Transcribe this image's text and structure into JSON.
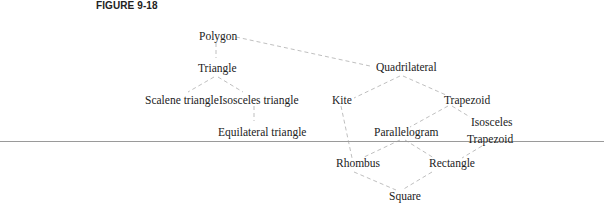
{
  "figure": {
    "title": "FIGURE 9-18"
  },
  "nodes": {
    "polygon": "Polygon",
    "triangle": "Triangle",
    "scalene": "Scalene triangle",
    "isosceles_triangle": "Isosceles triangle",
    "equilateral": "Equilateral triangle",
    "quadrilateral": "Quadrilateral",
    "kite": "Kite",
    "trapezoid": "Trapezoid",
    "isosceles_trapezoid_line1": "Isosceles",
    "isosceles_trapezoid_line2": "Trapezoid",
    "parallelogram": "Parallelogram",
    "rhombus": "Rhombus",
    "rectangle": "Rectangle",
    "square": "Square"
  },
  "edges": [
    [
      "Polygon",
      "Triangle"
    ],
    [
      "Polygon",
      "Quadrilateral"
    ],
    [
      "Triangle",
      "Scalene triangle"
    ],
    [
      "Triangle",
      "Isosceles triangle"
    ],
    [
      "Isosceles triangle",
      "Equilateral triangle"
    ],
    [
      "Quadrilateral",
      "Kite"
    ],
    [
      "Quadrilateral",
      "Trapezoid"
    ],
    [
      "Trapezoid",
      "Parallelogram"
    ],
    [
      "Trapezoid",
      "Isosceles Trapezoid"
    ],
    [
      "Kite",
      "Rhombus"
    ],
    [
      "Parallelogram",
      "Rhombus"
    ],
    [
      "Parallelogram",
      "Rectangle"
    ],
    [
      "Isosceles Trapezoid",
      "Rectangle"
    ],
    [
      "Rhombus",
      "Square"
    ],
    [
      "Rectangle",
      "Square"
    ]
  ],
  "style": {
    "edge_color": "#b8b8b8",
    "text_color": "#222222",
    "rule_color": "#9a9a9a"
  }
}
